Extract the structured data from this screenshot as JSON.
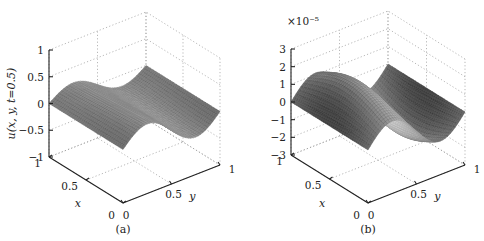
{
  "chart_data": [
    {
      "type": "surface",
      "caption": "(a)",
      "title": "",
      "xlabel": "x",
      "ylabel": "y",
      "zlabel": "u(x, y, t=0.5)",
      "x_ticks": [
        "0",
        "0.5",
        "1"
      ],
      "y_ticks": [
        "0",
        "0.5",
        "1"
      ],
      "z_ticks": [
        "−1",
        "−0.5",
        "0",
        "0.5",
        "1"
      ],
      "zlim": [
        -1,
        1
      ],
      "xlim": [
        0,
        1
      ],
      "ylim": [
        0,
        1
      ],
      "grid": true,
      "exponent_label": "",
      "surface": {
        "description": "wave along y: 0 at y=0, peak ~0.3 near y≈0.2, trough ~-0.3 near y≈0.8, nearly constant in x",
        "amplitude": 0.3,
        "x_modulation": 0.0,
        "phase": 0.0,
        "resolution": 40
      }
    },
    {
      "type": "surface",
      "caption": "(b)",
      "title": "",
      "xlabel": "x",
      "ylabel": "y",
      "zlabel": "",
      "x_ticks": [
        "0",
        "0.5",
        "1"
      ],
      "y_ticks": [
        "0",
        "0.5",
        "1"
      ],
      "z_ticks": [
        "−3",
        "−2",
        "−1",
        "0",
        "1",
        "2",
        "3"
      ],
      "zlim": [
        -3,
        3
      ],
      "xlim": [
        0,
        1
      ],
      "ylim": [
        0,
        1
      ],
      "grid": true,
      "exponent_label": "×10⁻⁵",
      "surface": {
        "description": "error surface (×10^-5): hump ~2 near y≈0.25 strongest at mid-x, trough ~-2 near y≈0.75",
        "amplitude": 2.0,
        "x_modulation": 1.0,
        "phase": 0.0,
        "resolution": 40
      }
    }
  ],
  "panels": {
    "a": {
      "caption": "(a)"
    },
    "b": {
      "caption": "(b)",
      "exponent": "×10⁻⁵"
    }
  }
}
